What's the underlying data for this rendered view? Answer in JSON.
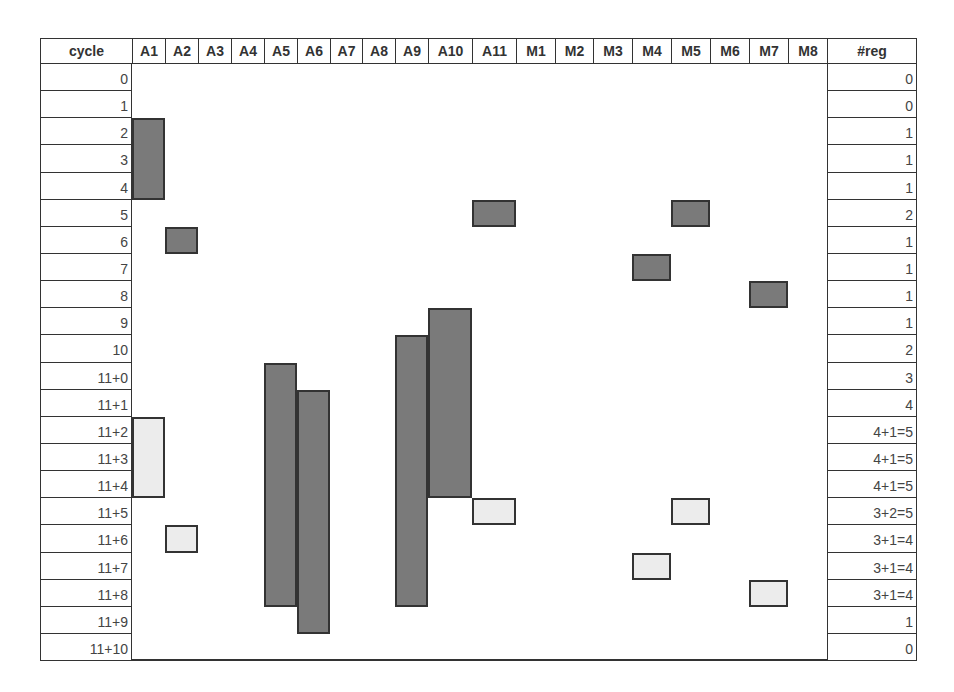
{
  "table": {
    "cycle_header": "cycle",
    "reg_header": "#reg",
    "columns": [
      "A1",
      "A2",
      "A3",
      "A4",
      "A5",
      "A6",
      "A7",
      "A8",
      "A9",
      "A10",
      "A11",
      "M1",
      "M2",
      "M3",
      "M4",
      "M5",
      "M6",
      "M7",
      "M8"
    ],
    "rows": [
      {
        "cycle": "0",
        "reg": "0"
      },
      {
        "cycle": "1",
        "reg": "0"
      },
      {
        "cycle": "2",
        "reg": "1"
      },
      {
        "cycle": "3",
        "reg": "1"
      },
      {
        "cycle": "4",
        "reg": "1"
      },
      {
        "cycle": "5",
        "reg": "2"
      },
      {
        "cycle": "6",
        "reg": "1"
      },
      {
        "cycle": "7",
        "reg": "1"
      },
      {
        "cycle": "8",
        "reg": "1"
      },
      {
        "cycle": "9",
        "reg": "1"
      },
      {
        "cycle": "10",
        "reg": "2"
      },
      {
        "cycle": "11+0",
        "reg": "3"
      },
      {
        "cycle": "11+1",
        "reg": "4"
      },
      {
        "cycle": "11+2",
        "reg": "4+1=5"
      },
      {
        "cycle": "11+3",
        "reg": "4+1=5"
      },
      {
        "cycle": "11+4",
        "reg": "4+1=5"
      },
      {
        "cycle": "11+5",
        "reg": "3+2=5"
      },
      {
        "cycle": "11+6",
        "reg": "3+1=4"
      },
      {
        "cycle": "11+7",
        "reg": "3+1=4"
      },
      {
        "cycle": "11+8",
        "reg": "3+1=4"
      },
      {
        "cycle": "11+9",
        "reg": "1"
      },
      {
        "cycle": "11+10",
        "reg": "0"
      }
    ]
  },
  "blocks": [
    {
      "col": "A1",
      "start_row": 2,
      "end_row": 4,
      "shade": "dark"
    },
    {
      "col": "A1",
      "start_row": 13,
      "end_row": 15,
      "shade": "light"
    },
    {
      "col": "A2",
      "start_row": 6,
      "end_row": 6,
      "shade": "dark"
    },
    {
      "col": "A2",
      "start_row": 17,
      "end_row": 17,
      "shade": "light"
    },
    {
      "col": "A5",
      "start_row": 11,
      "end_row": 19,
      "shade": "dark"
    },
    {
      "col": "A6",
      "start_row": 12,
      "end_row": 20,
      "shade": "dark"
    },
    {
      "col": "A9",
      "start_row": 10,
      "end_row": 19,
      "shade": "dark"
    },
    {
      "col": "A10",
      "start_row": 9,
      "end_row": 15,
      "shade": "dark"
    },
    {
      "col": "A11",
      "start_row": 5,
      "end_row": 5,
      "shade": "dark"
    },
    {
      "col": "A11",
      "start_row": 16,
      "end_row": 16,
      "shade": "light"
    },
    {
      "col": "M4",
      "start_row": 7,
      "end_row": 7,
      "shade": "dark"
    },
    {
      "col": "M4",
      "start_row": 18,
      "end_row": 18,
      "shade": "light"
    },
    {
      "col": "M5",
      "start_row": 5,
      "end_row": 5,
      "shade": "dark"
    },
    {
      "col": "M5",
      "start_row": 16,
      "end_row": 16,
      "shade": "light"
    },
    {
      "col": "M7",
      "start_row": 8,
      "end_row": 8,
      "shade": "dark"
    },
    {
      "col": "M7",
      "start_row": 19,
      "end_row": 19,
      "shade": "light"
    }
  ],
  "colors": {
    "dark": "#7a7a7a",
    "light": "#ececec",
    "border": "#333333"
  }
}
